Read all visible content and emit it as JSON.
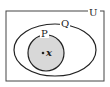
{
  "diagram": {
    "type": "venn",
    "universe": {
      "label": "U"
    },
    "sets": [
      {
        "label": "Q",
        "contains": [
          "P"
        ]
      },
      {
        "label": "P",
        "shaded": true
      }
    ],
    "element": {
      "label": "x",
      "in": "P"
    },
    "colors": {
      "stroke": "#222222",
      "shade": "#d8d8d8",
      "background": "#ffffff"
    }
  }
}
